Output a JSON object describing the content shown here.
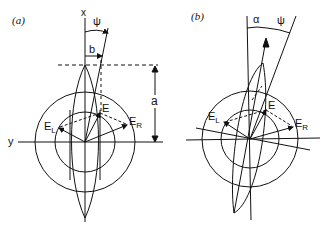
{
  "panels": [
    {
      "id": "a",
      "label": "(a)",
      "axis_x_label": "x",
      "axis_y_label": "y",
      "angle_label": "ψ",
      "offset_label": "b",
      "height_label": "a",
      "vector_labels": {
        "E": "E",
        "EL_main": "E",
        "EL_sub": "L",
        "ER_main": "E",
        "ER_sub": "R"
      }
    },
    {
      "id": "b",
      "label": "(b)",
      "angle_alpha_label": "α",
      "angle_psi_label": "ψ",
      "vector_labels": {
        "E": "E",
        "EL_main": "E",
        "EL_sub": "L",
        "ER_main": "E",
        "ER_sub": "R"
      }
    }
  ],
  "colors": {
    "stroke": "#111111",
    "background": "#ffffff"
  }
}
